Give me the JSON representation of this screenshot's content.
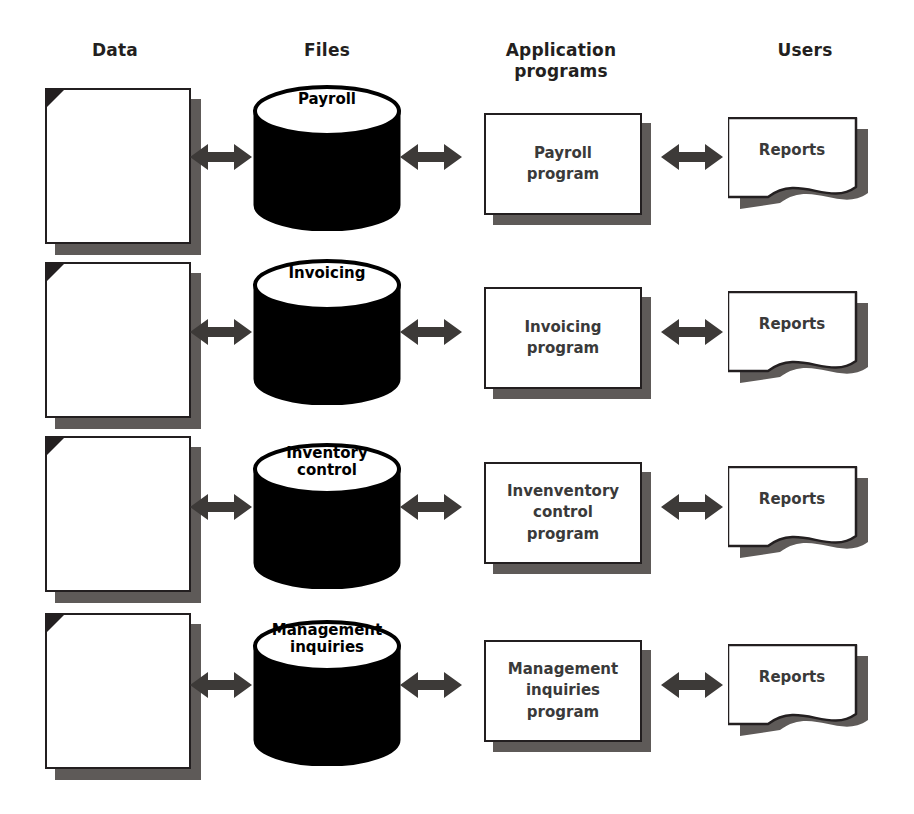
{
  "diagram": {
    "columns": [
      {
        "key": "data",
        "label": "Data"
      },
      {
        "key": "files",
        "label": "Files"
      },
      {
        "key": "programs",
        "label": "Application\nprograms"
      },
      {
        "key": "users",
        "label": "Users"
      }
    ],
    "rows": [
      {
        "id": "payroll",
        "data_label": "",
        "file_label": "Payroll",
        "program_label": "Payroll\nprogram",
        "user_label": "Reports"
      },
      {
        "id": "invoicing",
        "data_label": "",
        "file_label": "Invoicing",
        "program_label": "Invoicing\nprogram",
        "user_label": "Reports"
      },
      {
        "id": "inventory-control",
        "data_label": "",
        "file_label": "Inventory\ncontrol",
        "program_label": "Invenventory\ncontrol\nprogram",
        "user_label": "Reports"
      },
      {
        "id": "management-inquiries",
        "data_label": "",
        "file_label": "Management\ninquiries",
        "program_label": "Management\ninquiries\nprogram",
        "user_label": "Reports"
      }
    ],
    "connectors": {
      "type": "double-headed-arrow",
      "count_per_row": 3,
      "row_connector_labels": [
        "",
        "",
        ""
      ]
    },
    "colors": {
      "outline": "#231f20",
      "shadow": "#5e5a58",
      "cylinder_body": "#000000",
      "cylinder_top": "#ffffff",
      "arrow": "#3d3a38",
      "text": "#231f20",
      "box_text": "#3a3a3a",
      "background": "#ffffff"
    }
  }
}
